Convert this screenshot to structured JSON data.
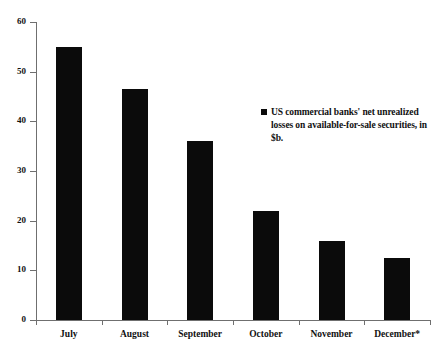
{
  "chart_data": {
    "type": "bar",
    "title": "",
    "subtitle": "",
    "xlabel": "",
    "ylabel": "",
    "categories": [
      "July",
      "August",
      "September",
      "October",
      "November",
      "December*"
    ],
    "values": [
      55,
      46.5,
      36,
      22,
      16,
      12.5
    ],
    "series": [
      {
        "name": "US commercial banks' net unrealized losses on available-for-sale securities, in $b.",
        "values": [
          55,
          46.5,
          36,
          22,
          16,
          12.5
        ]
      }
    ],
    "ylim": [
      0,
      60
    ],
    "yticks": [
      0,
      10,
      20,
      30,
      40,
      50,
      60
    ],
    "ytick_labels": [
      "0",
      "10",
      "20",
      "30",
      "40",
      "50",
      "60"
    ],
    "grid": false,
    "legend_position": "inside-upper-right",
    "bar_color": "#0b0b0b",
    "axis_color": "#6f6f6f",
    "background_color": "#ffffff"
  },
  "legend": {
    "marker_name": "square-marker",
    "text": "US commercial banks' net unrealized losses on available-for-sale securities, in $b."
  }
}
